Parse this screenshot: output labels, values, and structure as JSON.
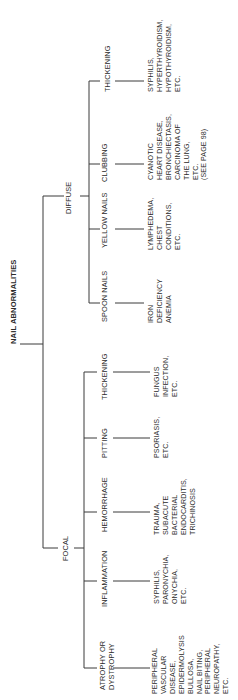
{
  "title": "NAIL ABNORMALITIES",
  "branches": {
    "focal": {
      "label": "FOCAL",
      "children": [
        {
          "label": "ATROPHY OR\nDYSTROPHY",
          "desc": "PERIPHERAL\nVASCULAR\nDISEASE,\nEPIDERMOLYSIS\nBULLOSA,\nNAIL BITING,\nPERIPHERAL\nNEUROPATHY,\nETC."
        },
        {
          "label": "INFLAMMATION",
          "desc": "SYPHILIS,\nPARONYCHIA,\nONYCHIA,\nETC."
        },
        {
          "label": "HEMORRHAGE",
          "desc": "TRAUMA,\nSUBACUTE\nBACTERIAL\nENDOCARDITIS,\nTRICHINOSIS"
        },
        {
          "label": "PITTING",
          "desc": "PSORIASIS,\nETC."
        },
        {
          "label": "THICKENING",
          "desc": "FUNGUS\nINFECTION,\nETC."
        }
      ]
    },
    "diffuse": {
      "label": "DIFFUSE",
      "children": [
        {
          "label": "SPOON NAILS",
          "desc": "IRON\nDEFICIENCY\nANEMIA"
        },
        {
          "label": "YELLOW NAILS",
          "desc": "LYMPHEDEMA,\nCHEST\nCONDITIONS,\nETC."
        },
        {
          "label": "CLUBBING",
          "desc": "CYANOTIC\nHEART DISEASE,\nBRONCHIECTASIS,\nCARCINOMA OF\nTHE LUNG,\nETC.\n(SEE PAGE 98)"
        },
        {
          "label": "THICKENING",
          "desc": "SYPHILIS,\nHYPERTHYROIDISM,\nHYPOTHYROIDISM,\nETC."
        }
      ]
    }
  },
  "colors": {
    "line": "#3a3a3a",
    "text": "#2a2a2a",
    "background": "#ffffff"
  }
}
